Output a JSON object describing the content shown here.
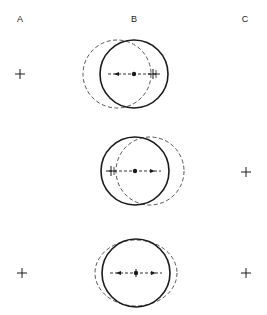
{
  "columns": [
    {
      "label": "A",
      "x": 20
    },
    {
      "label": "B",
      "x": 134
    },
    {
      "label": "C",
      "x": 245
    }
  ],
  "rows": [
    {
      "name": "row-1",
      "solid_circle": {
        "cx": 134,
        "cy": 74,
        "r": 34
      },
      "dashed_shape": {
        "cx": 117,
        "cy": 74,
        "rx": 34,
        "ry": 34
      },
      "arrows": [
        "left"
      ],
      "crosses_in_b": [
        {
          "x": 153,
          "y": 74
        }
      ],
      "cross_a": {
        "x": 20,
        "y": 74
      },
      "cross_c": null
    },
    {
      "name": "row-2",
      "solid_circle": {
        "cx": 135,
        "cy": 171,
        "r": 34
      },
      "dashed_shape": {
        "cx": 150,
        "cy": 171,
        "rx": 34,
        "ry": 34
      },
      "arrows": [
        "right"
      ],
      "crosses_in_b": [
        {
          "x": 111,
          "y": 171
        }
      ],
      "cross_a": null,
      "cross_c": {
        "x": 246,
        "y": 172
      }
    },
    {
      "name": "row-3",
      "solid_circle": {
        "cx": 136,
        "cy": 273,
        "r": 34
      },
      "dashed_shape": {
        "cx": 136,
        "cy": 273,
        "rx": 41,
        "ry": 33
      },
      "arrows": [
        "left",
        "right"
      ],
      "crosses_in_b": [],
      "cross_a": {
        "x": 22,
        "y": 273
      },
      "cross_c": {
        "x": 246,
        "y": 273
      }
    }
  ],
  "colors": {
    "stroke": "#1a1a1a",
    "dashed": "#555555"
  }
}
